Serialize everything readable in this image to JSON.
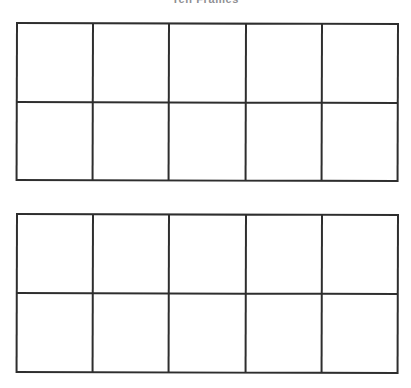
{
  "page": {
    "title": "Ten Frames",
    "background_color": "#ffffff",
    "line_color": "#2e2e2e",
    "title_color": "#8f8f93"
  },
  "worksheet": {
    "kind": "ten-frame-worksheet",
    "frame_count": 2,
    "rows_per_frame": 2,
    "columns_per_frame": 5,
    "cells_per_frame": 10,
    "frames": [
      {
        "name": "ten-frame-1",
        "cells": [
          "",
          "",
          "",
          "",
          "",
          "",
          "",
          "",
          "",
          ""
        ]
      },
      {
        "name": "ten-frame-2",
        "cells": [
          "",
          "",
          "",
          "",
          "",
          "",
          "",
          "",
          "",
          ""
        ]
      }
    ]
  }
}
